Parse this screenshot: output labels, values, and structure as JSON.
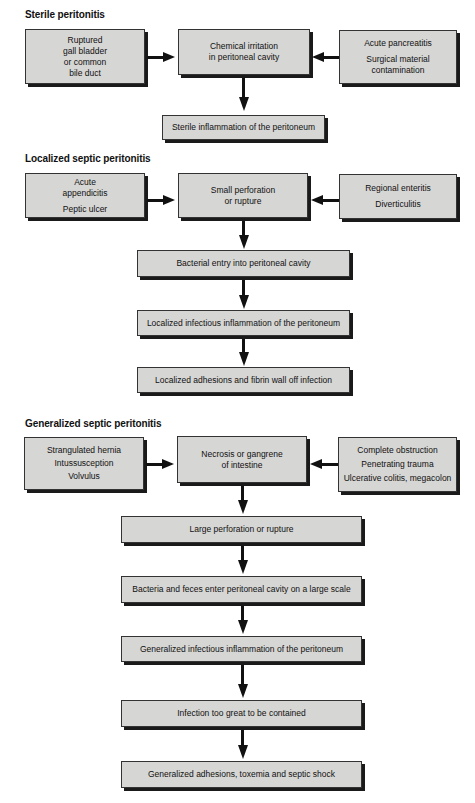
{
  "diagram": {
    "sections": [
      {
        "title": "Sterile peritonitis",
        "left_causes": [
          "Ruptured",
          "gall bladder",
          "or common",
          "bile duct"
        ],
        "right_causes": [
          "Acute pancreatitis",
          "Surgical material",
          "contamination"
        ],
        "central": [
          "Chemical irritation",
          "in peritoneal cavity"
        ],
        "chain": [
          "Sterile inflammation of the peritoneum"
        ]
      },
      {
        "title": "Localized septic peritonitis",
        "left_causes": [
          "Acute",
          "appendicitis",
          "Peptic ulcer"
        ],
        "right_causes": [
          "Regional enteritis",
          "Diverticulitis"
        ],
        "central": [
          "Small perforation",
          "or rupture"
        ],
        "chain": [
          "Bacterial entry into peritoneal cavity",
          "Localized infectious inflammation of the peritoneum",
          "Localized adhesions and fibrin wall off infection"
        ]
      },
      {
        "title": "Generalized septic peritonitis",
        "left_causes": [
          "Strangulated hernia",
          "Intussusception",
          "Volvulus"
        ],
        "right_causes": [
          "Complete obstruction",
          "Penetrating trauma",
          "Ulcerative colitis, megacolon"
        ],
        "central": [
          "Necrosis or gangrene",
          "of intestine"
        ],
        "chain": [
          "Large perforation or rupture",
          "Bacteria and feces enter peritoneal cavity on a large scale",
          "Generalized infectious inflammation of the peritoneum",
          "Infection too great to be contained",
          "Generalized adhesions, toxemia and septic shock"
        ]
      }
    ],
    "colors": {
      "box_fill": "#d6d6d4",
      "shadow": "#1a1a1a",
      "arrow": "#111111"
    }
  }
}
